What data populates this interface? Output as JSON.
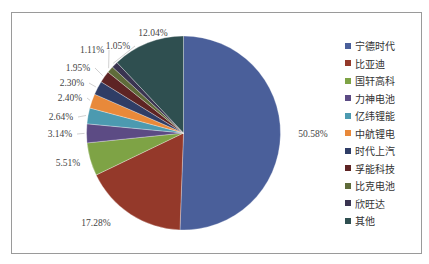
{
  "chart_data": {
    "type": "pie",
    "title": "",
    "start_angle": "12 o'clock, clockwise",
    "legend_position": "right",
    "categories": [
      "宁德时代",
      "比亚迪",
      "国轩高科",
      "力神电池",
      "亿纬锂能",
      "中航锂电",
      "时代上汽",
      "孚能科技",
      "比克电池",
      "欣旺达",
      "其他"
    ],
    "values": [
      50.58,
      17.28,
      5.51,
      3.14,
      2.64,
      2.4,
      2.3,
      1.95,
      1.11,
      1.05,
      12.04
    ],
    "labels": [
      "50.58%",
      "17.28%",
      "5.51%",
      "3.14%",
      "2.64%",
      "2.40%",
      "2.30%",
      "1.95%",
      "1.11%",
      "1.05%",
      "12.04%"
    ],
    "colors": [
      "#4a5f9a",
      "#94392a",
      "#7ea345",
      "#5c4b84",
      "#4c9ab0",
      "#e8893a",
      "#2f3d66",
      "#5e2424",
      "#5f6b3a",
      "#3a3450",
      "#2f4f50"
    ]
  },
  "legend": {
    "items": [
      "宁德时代",
      "比亚迪",
      "国轩高科",
      "力神电池",
      "亿纬锂能",
      "中航锂电",
      "时代上汽",
      "孚能科技",
      "比克电池",
      "欣旺达",
      "其他"
    ]
  }
}
